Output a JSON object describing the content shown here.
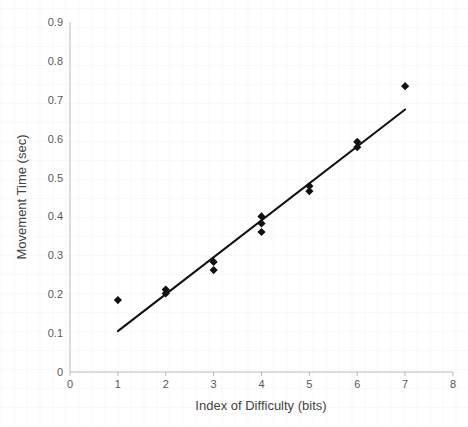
{
  "chart_data": {
    "type": "scatter",
    "title": "",
    "xlabel": "Index of Difficulty (bits)",
    "ylabel": "Movement Time (sec)",
    "xlim": [
      0,
      8
    ],
    "ylim": [
      0,
      0.9
    ],
    "grid": false,
    "legend": "none",
    "xticks": [
      "0",
      "1",
      "2",
      "3",
      "4",
      "5",
      "6",
      "7",
      "8"
    ],
    "xtick_values": [
      0,
      1,
      2,
      3,
      4,
      5,
      6,
      7,
      8
    ],
    "yticks": [
      "0",
      "0.1",
      "0.2",
      "0.3",
      "0.4",
      "0.5",
      "0.6",
      "0.7",
      "0.8",
      "0.9"
    ],
    "ytick_values": [
      0,
      0.1,
      0.2,
      0.3,
      0.4,
      0.5,
      0.6,
      0.7,
      0.8,
      0.9
    ],
    "marker": "diamond",
    "marker_color": "#111111",
    "series": [
      {
        "name": "Movement Time",
        "points": [
          {
            "x": 1.0,
            "y": 0.185
          },
          {
            "x": 2.0,
            "y": 0.212
          },
          {
            "x": 2.0,
            "y": 0.202
          },
          {
            "x": 3.0,
            "y": 0.283
          },
          {
            "x": 3.0,
            "y": 0.262
          },
          {
            "x": 4.0,
            "y": 0.4
          },
          {
            "x": 4.0,
            "y": 0.382
          },
          {
            "x": 4.0,
            "y": 0.36
          },
          {
            "x": 5.0,
            "y": 0.478
          },
          {
            "x": 5.0,
            "y": 0.465
          },
          {
            "x": 6.0,
            "y": 0.592
          },
          {
            "x": 6.0,
            "y": 0.578
          },
          {
            "x": 7.0,
            "y": 0.735
          }
        ]
      }
    ],
    "trendline": {
      "name": "linear fit",
      "color": "#111111",
      "x0": 1.0,
      "y0": 0.105,
      "x1": 7.0,
      "y1": 0.675
    }
  }
}
